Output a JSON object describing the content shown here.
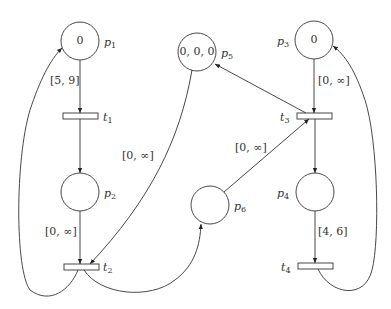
{
  "diagram": {
    "type": "time-petri-net",
    "places": [
      {
        "id": "p1",
        "name": "p",
        "sub": "1",
        "tokens": "0",
        "cx": 80,
        "cy": 41
      },
      {
        "id": "p2",
        "name": "p",
        "sub": "2",
        "tokens": "",
        "cx": 80,
        "cy": 192
      },
      {
        "id": "p3",
        "name": "p",
        "sub": "3",
        "tokens": "0",
        "cx": 314,
        "cy": 40
      },
      {
        "id": "p4",
        "name": "p",
        "sub": "4",
        "tokens": "",
        "cx": 315,
        "cy": 192
      },
      {
        "id": "p5",
        "name": "p",
        "sub": "5",
        "tokens": "0, 0, 0",
        "cx": 197,
        "cy": 52
      },
      {
        "id": "p6",
        "name": "p",
        "sub": "6",
        "tokens": "",
        "cx": 210,
        "cy": 205
      }
    ],
    "transitions": [
      {
        "id": "t1",
        "name": "t",
        "sub": "1",
        "cx": 80,
        "cy": 116
      },
      {
        "id": "t2",
        "name": "t",
        "sub": "2",
        "cx": 81,
        "cy": 267
      },
      {
        "id": "t3",
        "name": "t",
        "sub": "3",
        "cx": 314,
        "cy": 116
      },
      {
        "id": "t4",
        "name": "t",
        "sub": "4",
        "cx": 315,
        "cy": 266
      }
    ],
    "arc_labels": [
      {
        "id": "p1-t1",
        "text": "[5, 9]"
      },
      {
        "id": "p2-t2",
        "text": "[0, ∞]"
      },
      {
        "id": "p5-t2",
        "text": "[0, ∞]"
      },
      {
        "id": "p3-t3",
        "text": "[0, ∞]"
      },
      {
        "id": "p6-t3",
        "text": "[0, ∞]"
      },
      {
        "id": "p4-t4",
        "text": "[4, 6]"
      }
    ],
    "arcs": [
      "p1→t1",
      "t1→p2",
      "p2→t2",
      "p5→t2",
      "t2→p1",
      "t2→p6",
      "p3→t3",
      "p6→t3",
      "t3→p5",
      "t3→p4",
      "p4→t4",
      "t4→p3"
    ]
  }
}
